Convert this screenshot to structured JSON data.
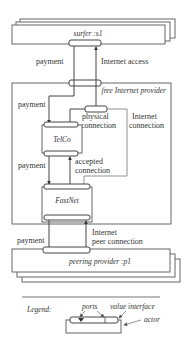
{
  "diagram": {
    "type": "e3value model",
    "actors": {
      "surfer": {
        "label": "surfer :s1",
        "kind": "market segment"
      },
      "provider": {
        "label": "free Internet provider",
        "kind": "actor (composite)"
      },
      "telco": {
        "label": "TelCo",
        "kind": "actor"
      },
      "fastnet": {
        "label": "FastNet",
        "kind": "actor"
      },
      "peering": {
        "label": "peering provider :p1",
        "kind": "market segment"
      }
    },
    "value_exchanges": [
      {
        "id": "ex1",
        "label": "payment",
        "from": "surfer",
        "to": "telco"
      },
      {
        "id": "ex2",
        "label": "Internet access",
        "from": "provider",
        "to": "surfer"
      },
      {
        "id": "ex3",
        "label": "physical connection",
        "from": "telco",
        "to": "provider"
      },
      {
        "id": "ex4",
        "label": "Internet connection",
        "from": "fastnet",
        "to": "provider"
      },
      {
        "id": "ex5",
        "label": "payment",
        "from": "telco",
        "to": "fastnet"
      },
      {
        "id": "ex6",
        "label": "accepted connection",
        "from": "fastnet",
        "to": "telco"
      },
      {
        "id": "ex7",
        "label": "payment",
        "from": "fastnet",
        "to": "peering"
      },
      {
        "id": "ex8",
        "label": "Internet peer connection",
        "from": "peering",
        "to": "fastnet"
      }
    ],
    "labels": {
      "payment_top": "payment",
      "internet_access": "Internet access",
      "payment_mid": "payment",
      "physical_1": "physical",
      "physical_2": "connection",
      "internet_conn_1": "Internet",
      "internet_conn_2": "connection",
      "payment_low": "payment",
      "accepted_1": "accepted",
      "accepted_2": "connection",
      "payment_bottom": "payment",
      "peer_1": "Internet",
      "peer_2": "peer connection"
    },
    "legend": {
      "title": "Legend:",
      "ports": "ports",
      "value_interface": "value interface",
      "actor": "actor"
    }
  }
}
